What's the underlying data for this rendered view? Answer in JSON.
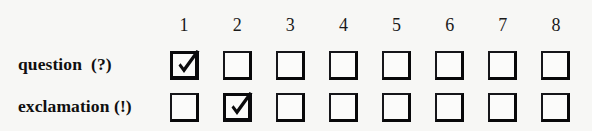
{
  "matrix": {
    "columns": [
      "1",
      "2",
      "3",
      "4",
      "5",
      "6",
      "7",
      "8"
    ],
    "rows": [
      {
        "label": "question  (?)",
        "checked_column": "1",
        "cells": [
          {
            "column": "1",
            "checked": true,
            "state": "checked"
          },
          {
            "column": "2",
            "checked": false,
            "state": "unchecked"
          },
          {
            "column": "3",
            "checked": false,
            "state": "unchecked"
          },
          {
            "column": "4",
            "checked": false,
            "state": "unchecked"
          },
          {
            "column": "5",
            "checked": false,
            "state": "unchecked"
          },
          {
            "column": "6",
            "checked": false,
            "state": "unchecked"
          },
          {
            "column": "7",
            "checked": false,
            "state": "unchecked"
          },
          {
            "column": "8",
            "checked": false,
            "state": "unchecked"
          }
        ]
      },
      {
        "label": "exclamation (!)",
        "checked_column": "2",
        "cells": [
          {
            "column": "1",
            "checked": false,
            "state": "unchecked"
          },
          {
            "column": "2",
            "checked": true,
            "state": "checked"
          },
          {
            "column": "3",
            "checked": false,
            "state": "unchecked"
          },
          {
            "column": "4",
            "checked": false,
            "state": "unchecked"
          },
          {
            "column": "5",
            "checked": false,
            "state": "unchecked"
          },
          {
            "column": "6",
            "checked": false,
            "state": "unchecked"
          },
          {
            "column": "7",
            "checked": false,
            "state": "unchecked"
          },
          {
            "column": "8",
            "checked": false,
            "state": "unchecked"
          }
        ]
      }
    ],
    "icons": {
      "checked": "checkmark-icon",
      "unchecked": "empty-box-icon"
    },
    "colors": {
      "background": "#f7f7f5",
      "ink": "#100f0f",
      "box_border": "#16161a",
      "box_fill": "#fbfbfa"
    }
  }
}
